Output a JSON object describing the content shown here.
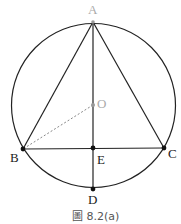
{
  "figure": {
    "caption": "圖 8.2(a)",
    "circle": {
      "cx": 93.5,
      "cy": 105.5,
      "r": 82
    },
    "points": {
      "A": {
        "label": "A",
        "x": 93,
        "y": 22
      },
      "O": {
        "label": "O",
        "x": 93,
        "y": 105
      },
      "B": {
        "label": "B",
        "x": 23,
        "y": 149
      },
      "C": {
        "label": "C",
        "x": 164,
        "y": 148
      },
      "E": {
        "label": "E",
        "x": 93,
        "y": 148
      },
      "D": {
        "label": "D",
        "x": 93,
        "y": 189
      }
    },
    "segments": [
      {
        "from": "A",
        "to": "B",
        "style": "solid"
      },
      {
        "from": "A",
        "to": "C",
        "style": "solid"
      },
      {
        "from": "B",
        "to": "C",
        "style": "solid"
      },
      {
        "from": "A",
        "to": "D",
        "style": "solid"
      },
      {
        "from": "O",
        "to": "B",
        "style": "dashed"
      }
    ],
    "colors": {
      "line": "#222222",
      "muted": "#aaaaaa",
      "dashed": "#888888"
    }
  }
}
